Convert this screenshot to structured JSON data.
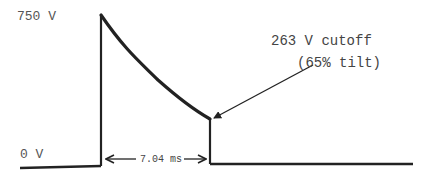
{
  "diagram": {
    "type": "waveform",
    "labels": {
      "peak_voltage": "750 V",
      "baseline_voltage": "0 V",
      "cutoff_voltage": "263 V cutoff",
      "tilt": "(65% tilt)",
      "duration": "7.04 ms"
    },
    "values": {
      "peak_v": 750,
      "cutoff_v": 263,
      "tilt_percent": 65,
      "duration_ms": 7.04
    },
    "colors": {
      "line": "#222222",
      "text": "#555555",
      "background": "#ffffff"
    }
  }
}
